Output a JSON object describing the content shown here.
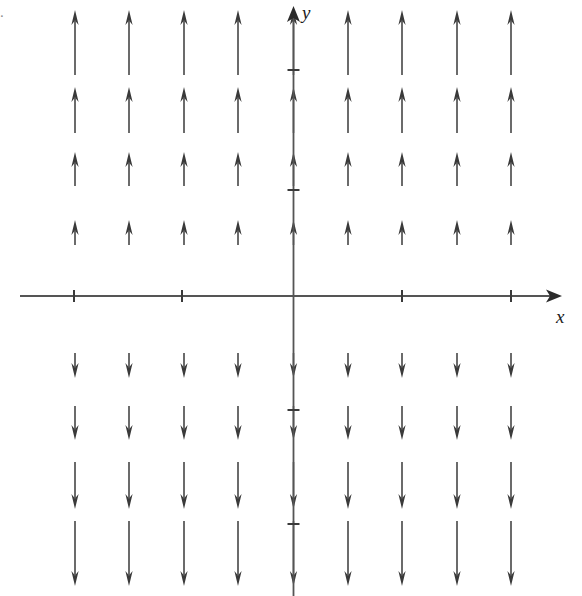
{
  "figure": {
    "label": ".",
    "width": 582,
    "height": 596,
    "background_color": "#ffffff",
    "ink_color": "#3a3a3a",
    "axis_color": "#555555"
  },
  "axes": {
    "x_label": "x",
    "y_label": "y",
    "origin_px": {
      "x": 293.5,
      "y": 296
    },
    "x_axis_pixel_span": [
      20,
      562
    ],
    "y_axis_pixel_span": [
      8,
      596
    ],
    "x_tick_px": [
      74,
      182,
      402,
      511
    ],
    "y_tick_px": [
      70,
      190,
      410,
      524
    ],
    "tick_half_length_px": 6,
    "x_arrowhead": true,
    "y_arrowhead": true,
    "tick_labels": []
  },
  "chart_data": {
    "type": "scatter",
    "subtype": "vector-field",
    "title": "",
    "xlabel": "x",
    "ylabel": "y",
    "grid": false,
    "legend": null,
    "xlim": [
      -5.45,
      5.0
    ],
    "ylim": [
      -5.55,
      5.45
    ],
    "x_tick_values": [
      -4,
      -2,
      2,
      4
    ],
    "y_tick_values": [
      4,
      2,
      -2,
      -4
    ],
    "axis_unit_px": 54.5,
    "columns_x": [
      -4,
      -3,
      -2,
      -1,
      0,
      1,
      2,
      3,
      4
    ],
    "rows_y": [
      4.5,
      3.5,
      2.5,
      1.5,
      -1.5,
      -2.5,
      -3.5,
      -4.5
    ],
    "arrow_rows": [
      {
        "y": 4.5,
        "direction": "up",
        "length_px": 65,
        "tail_px": 75,
        "head_px": 10
      },
      {
        "y": 3.5,
        "direction": "up",
        "length_px": 46,
        "tail_px": 133,
        "head_px": 87
      },
      {
        "y": 2.5,
        "direction": "up",
        "length_px": 34,
        "tail_px": 186,
        "head_px": 152
      },
      {
        "y": 1.5,
        "direction": "up",
        "length_px": 25,
        "tail_px": 245,
        "head_px": 220
      },
      {
        "y": -1.5,
        "direction": "down",
        "length_px": 25,
        "tail_px": 353,
        "head_px": 378
      },
      {
        "y": -2.5,
        "direction": "down",
        "length_px": 34,
        "tail_px": 406,
        "head_px": 440
      },
      {
        "y": -3.5,
        "direction": "down",
        "length_px": 47,
        "tail_px": 462,
        "head_px": 509
      },
      {
        "y": -4.5,
        "direction": "down",
        "length_px": 65,
        "tail_px": 521,
        "head_px": 586
      }
    ],
    "columns_px": [
      75,
      129,
      184,
      238,
      293.5,
      348,
      402,
      457,
      511
    ],
    "arrow_count": 72,
    "field_components": {
      "dx": 0,
      "dy": "proportional to y"
    }
  }
}
